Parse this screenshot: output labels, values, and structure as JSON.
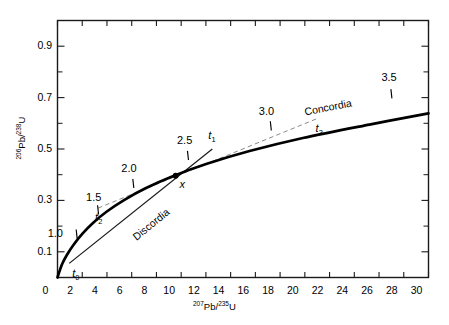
{
  "chart_data": {
    "type": "line",
    "title": "",
    "xlabel": "207Pb/235U",
    "ylabel": "206Pb/238U",
    "xlim": [
      0,
      30
    ],
    "ylim": [
      0,
      1.0
    ],
    "grid": false,
    "legend_position": "inline-annotations",
    "x_ticks": [
      0,
      2,
      4,
      6,
      8,
      10,
      12,
      14,
      16,
      18,
      20,
      22,
      24,
      26,
      28,
      30
    ],
    "x_tick_labels": [
      "0",
      "2",
      "4",
      "6",
      "8",
      "10",
      "12",
      "14",
      "16",
      "18",
      "20",
      "22",
      "24",
      "26",
      "28",
      "30"
    ],
    "y_ticks_major": [
      0.1,
      0.3,
      0.5,
      0.7,
      0.9
    ],
    "y_tick_labels": [
      "0.1",
      "0.3",
      "0.5",
      "0.7",
      "0.9"
    ],
    "y_ticks_minor": [
      0.2,
      0.4,
      0.6,
      0.8
    ],
    "series": [
      {
        "name": "Concordia",
        "style": "solid-thick",
        "points_x": [
          0.0,
          0.35,
          0.78,
          1.33,
          2.02,
          2.89,
          3.99,
          5.38,
          7.12,
          9.32,
          12.08,
          15.53,
          19.84,
          25.22,
          30.0
        ],
        "points_y": [
          0.0,
          0.0499,
          0.0893,
          0.1296,
          0.1709,
          0.2133,
          0.2568,
          0.3014,
          0.3472,
          0.3942,
          0.4425,
          0.492,
          0.5428,
          0.595,
          0.6386
        ]
      },
      {
        "name": "Discordia",
        "style": "solid-thin",
        "points_x": [
          0.95,
          12.52
        ],
        "points_y": [
          0.055,
          0.4998
        ]
      },
      {
        "name": "Secondary chord (t2 to t3)",
        "style": "dashed",
        "points_x": [
          3.28,
          20.95
        ],
        "points_y": [
          0.27,
          0.6175
        ]
      }
    ],
    "age_markers": [
      {
        "label": "1.0",
        "x": 1.55,
        "y": 0.169
      },
      {
        "label": "1.5",
        "x": 3.28,
        "y": 0.263
      },
      {
        "label": "2.0",
        "x": 6.13,
        "y": 0.366
      },
      {
        "label": "2.5",
        "x": 10.55,
        "y": 0.475
      },
      {
        "label": "3.0",
        "x": 17.25,
        "y": 0.59
      },
      {
        "label": "3.5",
        "x": 27.0,
        "y": 0.715
      }
    ],
    "annotations": [
      {
        "name": "t0",
        "label": "t",
        "sub": "0",
        "x": 0.95,
        "y": 0.05
      },
      {
        "name": "t1",
        "label": "t",
        "sub": "1",
        "x": 12.52,
        "y": 0.4998
      },
      {
        "name": "t2",
        "label": "t",
        "sub": "2",
        "x": 3.28,
        "y": 0.27
      },
      {
        "name": "t3",
        "label": "t",
        "sub": "3",
        "x": 20.95,
        "y": 0.6175
      },
      {
        "name": "x",
        "label": "x",
        "sub": "",
        "x": 9.55,
        "y": 0.396
      }
    ],
    "data_points": [
      {
        "label": "x",
        "x": 9.55,
        "y": 0.396,
        "marker": "filled-circle"
      }
    ],
    "curve_labels": [
      {
        "text": "Concordia",
        "x": 22.0,
        "y": 0.655
      },
      {
        "text": "Discordia",
        "x": 7.6,
        "y": 0.215
      }
    ]
  },
  "axes": {
    "x_title_pre": "207",
    "x_title_mid": "Pb/",
    "x_title_sup": "235",
    "x_title_end": "U",
    "y_title_pre": "206",
    "y_title_mid": "Pb/",
    "y_title_sup": "238",
    "y_title_end": "U"
  },
  "colors": {
    "axis": "#1a1a1a",
    "concordia": "#000000",
    "discordia": "#1a1a1a",
    "dashed": "#8a8a8a",
    "text": "#000000",
    "background": "#ffffff"
  }
}
